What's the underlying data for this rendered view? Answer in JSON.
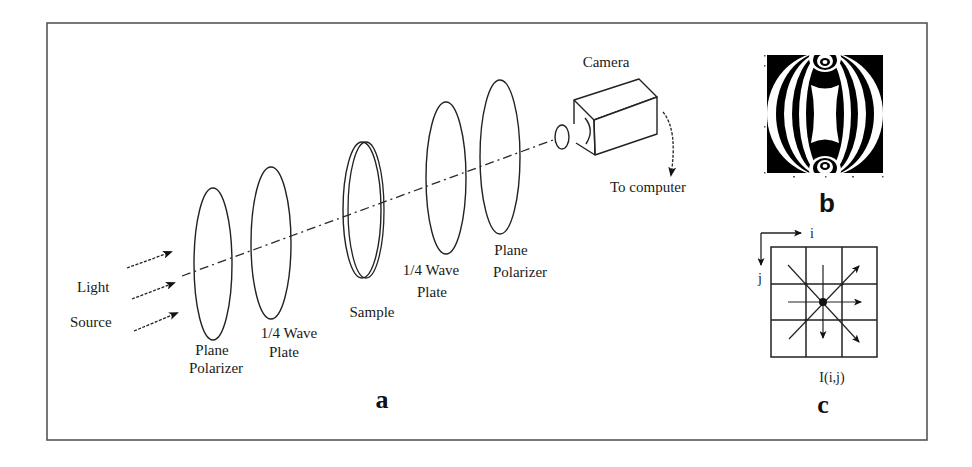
{
  "figure": {
    "panel_a": {
      "letter": "a",
      "light_source": {
        "line1": "Light",
        "line2": "Source"
      },
      "components": [
        {
          "name": "Plane Polarizer",
          "line1": "Plane",
          "line2": "Polarizer"
        },
        {
          "name": "1/4 Wave Plate",
          "line1": "1/4 Wave",
          "line2": "Plate"
        },
        {
          "name": "Sample",
          "line1": "Sample"
        },
        {
          "name": "1/4 Wave Plate",
          "line1": "1/4 Wave",
          "line2": "Plate"
        },
        {
          "name": "Plane Polarizer",
          "line1": "Plane",
          "line2": "Polarizer"
        }
      ],
      "camera": {
        "label": "Camera",
        "output_label": "To computer"
      }
    },
    "panel_b": {
      "letter": "b",
      "description": "Isochromatic fringe pattern image",
      "colors": {
        "dark": "#000000",
        "light": "#ffffff"
      }
    },
    "panel_c": {
      "letter": "c",
      "axis_i": "i",
      "axis_j": "j",
      "pixel_label": "I(i,j)",
      "grid": {
        "rows": 3,
        "cols": 3
      },
      "directions": [
        "right",
        "down",
        "up-right",
        "down-right"
      ]
    },
    "colors": {
      "background": "#ffffff",
      "line": "#222222",
      "frame": "#555555"
    }
  }
}
